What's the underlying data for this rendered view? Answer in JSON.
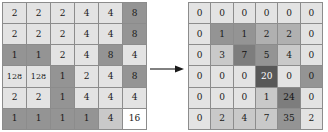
{
  "diagram": {
    "type": "matrix-transformation",
    "arrow": {
      "symbol": "arrow-right",
      "label": ""
    }
  },
  "grid_left": {
    "name": "source-matrix",
    "rows": 6,
    "cols": 6,
    "cells": [
      [
        {
          "value": "2",
          "shade": "light"
        },
        {
          "value": "2",
          "shade": "light"
        },
        {
          "value": "2",
          "shade": "light"
        },
        {
          "value": "4",
          "shade": "light"
        },
        {
          "value": "4",
          "shade": "light"
        },
        {
          "value": "8",
          "shade": "dark"
        }
      ],
      [
        {
          "value": "2",
          "shade": "light"
        },
        {
          "value": "2",
          "shade": "light"
        },
        {
          "value": "2",
          "shade": "light"
        },
        {
          "value": "4",
          "shade": "light"
        },
        {
          "value": "4",
          "shade": "light"
        },
        {
          "value": "8",
          "shade": "dark"
        }
      ],
      [
        {
          "value": "1",
          "shade": "dark"
        },
        {
          "value": "1",
          "shade": "dark"
        },
        {
          "value": "2",
          "shade": "light"
        },
        {
          "value": "4",
          "shade": "light"
        },
        {
          "value": "8",
          "shade": "dark"
        },
        {
          "value": "4",
          "shade": "light"
        }
      ],
      [
        {
          "value": "128",
          "shade": "light"
        },
        {
          "value": "128",
          "shade": "light"
        },
        {
          "value": "1",
          "shade": "dark"
        },
        {
          "value": "2",
          "shade": "light"
        },
        {
          "value": "4",
          "shade": "light"
        },
        {
          "value": "8",
          "shade": "dark"
        }
      ],
      [
        {
          "value": "2",
          "shade": "light"
        },
        {
          "value": "2",
          "shade": "light"
        },
        {
          "value": "1",
          "shade": "dark"
        },
        {
          "value": "4",
          "shade": "light"
        },
        {
          "value": "4",
          "shade": "light"
        },
        {
          "value": "4",
          "shade": "light"
        }
      ],
      [
        {
          "value": "1",
          "shade": "dark"
        },
        {
          "value": "1",
          "shade": "dark"
        },
        {
          "value": "1",
          "shade": "dark"
        },
        {
          "value": "1",
          "shade": "dark"
        },
        {
          "value": "4",
          "shade": "med"
        },
        {
          "value": "16",
          "shade": "white"
        }
      ]
    ]
  },
  "grid_right": {
    "name": "result-matrix",
    "rows": 6,
    "cols": 6,
    "cells": [
      [
        {
          "value": "0",
          "shade": "light"
        },
        {
          "value": "0",
          "shade": "light"
        },
        {
          "value": "0",
          "shade": "light"
        },
        {
          "value": "0",
          "shade": "light"
        },
        {
          "value": "0",
          "shade": "light"
        },
        {
          "value": "0",
          "shade": "light"
        }
      ],
      [
        {
          "value": "0",
          "shade": "light"
        },
        {
          "value": "1",
          "shade": "dark"
        },
        {
          "value": "1",
          "shade": "dark"
        },
        {
          "value": "2",
          "shade": "mid"
        },
        {
          "value": "2",
          "shade": "mid"
        },
        {
          "value": "0",
          "shade": "light"
        }
      ],
      [
        {
          "value": "0",
          "shade": "light"
        },
        {
          "value": "3",
          "shade": "med"
        },
        {
          "value": "7",
          "shade": "darker"
        },
        {
          "value": "5",
          "shade": "dark"
        },
        {
          "value": "4",
          "shade": "med"
        },
        {
          "value": "0",
          "shade": "light"
        }
      ],
      [
        {
          "value": "0",
          "shade": "light"
        },
        {
          "value": "0",
          "shade": "light"
        },
        {
          "value": "0",
          "shade": "light"
        },
        {
          "value": "20",
          "shade": "black"
        },
        {
          "value": "0",
          "shade": "light"
        },
        {
          "value": "0",
          "shade": "dark"
        }
      ],
      [
        {
          "value": "0",
          "shade": "light"
        },
        {
          "value": "0",
          "shade": "light"
        },
        {
          "value": "0",
          "shade": "light"
        },
        {
          "value": "1",
          "shade": "med"
        },
        {
          "value": "24",
          "shade": "darker"
        },
        {
          "value": "0",
          "shade": "light"
        }
      ],
      [
        {
          "value": "0",
          "shade": "light"
        },
        {
          "value": "2",
          "shade": "med"
        },
        {
          "value": "4",
          "shade": "med"
        },
        {
          "value": "7",
          "shade": "med"
        },
        {
          "value": "35",
          "shade": "dark"
        },
        {
          "value": "2",
          "shade": "light"
        }
      ]
    ]
  }
}
